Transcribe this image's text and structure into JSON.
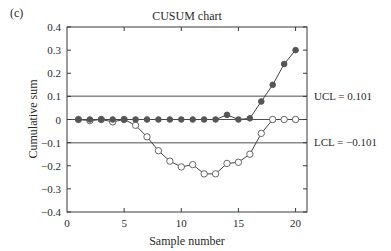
{
  "panel_label": "(c)",
  "chart_data": {
    "type": "line",
    "title": "CUSUM chart",
    "xlabel": "Sample number",
    "ylabel": "Cumulative sum",
    "xlim": [
      0,
      21
    ],
    "ylim": [
      -0.4,
      0.4
    ],
    "xticks": [
      0,
      5,
      10,
      15,
      20
    ],
    "yticks": [
      0.4,
      0.3,
      0.2,
      0.1,
      0,
      -0.1,
      -0.2,
      -0.3,
      -0.4
    ],
    "ytick_labels": [
      "0.4",
      "0.3",
      "0.2",
      "0.1",
      "0",
      "−0.1",
      "−0.2",
      "−0.3",
      "−0.4"
    ],
    "grid": false,
    "reference_lines": [
      {
        "name": "UCL",
        "value": 0.101,
        "label": "UCL = 0.101"
      },
      {
        "name": "center",
        "value": 0,
        "label": ""
      },
      {
        "name": "LCL",
        "value": -0.101,
        "label": "LCL = −0.101"
      }
    ],
    "x": [
      1,
      2,
      3,
      4,
      5,
      6,
      7,
      8,
      9,
      10,
      11,
      12,
      13,
      14,
      15,
      16,
      17,
      18,
      19,
      20
    ],
    "series": [
      {
        "name": "Upper CUSUM (C+)",
        "marker": "filled-circle",
        "values": [
          0,
          0,
          0,
          0,
          0,
          0,
          0,
          0,
          0,
          0,
          0,
          0,
          0,
          0.02,
          0,
          0.005,
          0.078,
          0.15,
          0.24,
          0.3
        ]
      },
      {
        "name": "Lower CUSUM (C−)",
        "marker": "open-circle",
        "values": [
          0,
          -0.005,
          0,
          -0.01,
          0,
          -0.025,
          -0.075,
          -0.135,
          -0.18,
          -0.205,
          -0.195,
          -0.235,
          -0.235,
          -0.19,
          -0.185,
          -0.15,
          -0.06,
          0,
          0,
          0
        ]
      }
    ]
  },
  "colors": {
    "axis": "#3a3a3a",
    "filled_marker": "#555555",
    "open_marker_stroke": "#555555",
    "line": "#444444"
  }
}
